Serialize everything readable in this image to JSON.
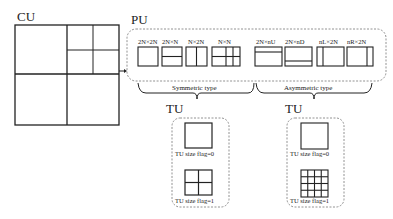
{
  "cu": {
    "label": "CU"
  },
  "pu": {
    "label": "PU",
    "symmetric": [
      {
        "label": "2N×2N",
        "split": "none"
      },
      {
        "label": "2N×N",
        "split": "horizontal-half"
      },
      {
        "label": "N×2N",
        "split": "vertical-half"
      },
      {
        "label": "N×N",
        "split": "quad"
      }
    ],
    "asymmetric": [
      {
        "label": "2N×nU",
        "split": "horizontal-quarter-top"
      },
      {
        "label": "2N×nD",
        "split": "horizontal-quarter-bottom"
      },
      {
        "label": "nL×2N",
        "split": "vertical-quarter-left"
      },
      {
        "label": "nR×2N",
        "split": "vertical-quarter-right"
      }
    ],
    "symmetric_group_label": "Symmetric type",
    "asymmetric_group_label": "Asymmetric type"
  },
  "tu_left": {
    "label": "TU",
    "flag0": "TU size flag=0",
    "flag1": "TU size flag=1"
  },
  "tu_right": {
    "label": "TU",
    "flag0": "TU size flag=0",
    "flag1": "TU size flag=1"
  },
  "colors": {
    "stroke": "#222222",
    "dashed": "#777777",
    "background": "#ffffff"
  }
}
